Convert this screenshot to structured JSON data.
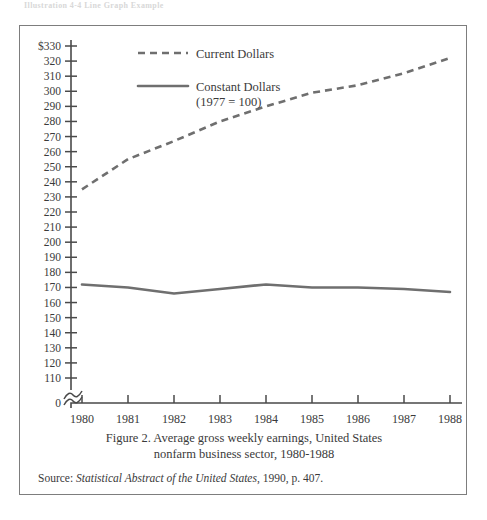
{
  "page": {
    "top_partial_text": "Illustration 4-4   Line Graph Example"
  },
  "caption": {
    "line1": "Figure 2.  Average gross weekly earnings, United States",
    "line2": "nonfarm business sector, 1980-1988"
  },
  "source": {
    "prefix": "Source:",
    "italic_title": "Statistical Abstract of the United States",
    "suffix": ", 1990, p. 407."
  },
  "colors": {
    "line": "#6f6f6f",
    "axis": "#4a4a4a",
    "text": "#3a3a3a",
    "frame": "#7d7d7d"
  },
  "chart_data": {
    "type": "line",
    "title": "Average gross weekly earnings, United States nonfarm business sector, 1980-1988",
    "xlabel": "",
    "ylabel": "",
    "x": [
      1980,
      1981,
      1982,
      1983,
      1984,
      1985,
      1986,
      1987,
      1988
    ],
    "categories": [
      "1980",
      "1981",
      "1982",
      "1983",
      "1984",
      "1985",
      "1986",
      "1987",
      "1988"
    ],
    "series": [
      {
        "name": "Current Dollars",
        "style": "dashed",
        "values": [
          235,
          255,
          267,
          280,
          290,
          299,
          304,
          312,
          322
        ]
      },
      {
        "name": "Constant Dollars",
        "style": "solid",
        "note": "(1977 = 100)",
        "values": [
          172,
          170,
          166,
          169,
          172,
          170,
          170,
          169,
          167
        ]
      }
    ],
    "ylim": [
      110,
      330
    ],
    "y_axis_break": true,
    "y_break_label": "0",
    "yticks": [
      330,
      320,
      310,
      300,
      290,
      280,
      270,
      260,
      250,
      240,
      230,
      220,
      210,
      200,
      190,
      180,
      170,
      160,
      150,
      140,
      130,
      120,
      110
    ],
    "ytick_labels": [
      "$330",
      "320",
      "310",
      "300",
      "290",
      "280",
      "270",
      "260",
      "250",
      "240",
      "230",
      "220",
      "210",
      "200",
      "190",
      "180",
      "170",
      "160",
      "150",
      "140",
      "130",
      "120",
      "110"
    ],
    "grid": false,
    "legend_position": "top-center",
    "legend": [
      "Current Dollars",
      "Constant Dollars"
    ]
  }
}
